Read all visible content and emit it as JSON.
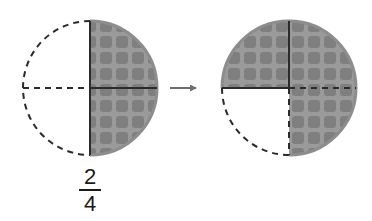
{
  "figure": {
    "background_color": "#ffffff",
    "shade_fill": "#9a9a9a",
    "shade_cell_color": "#7f7f7f",
    "outline_color": "#2b2b2b",
    "arrow_color": "#6e6e6e",
    "circles": [
      {
        "name": "left-circle",
        "cx": 90,
        "cy": 88,
        "r": 67,
        "total_parts": 4,
        "shaded_parts": 2,
        "quadrants": [
          {
            "name": "top-left",
            "shaded": false,
            "arc_style": "dashed"
          },
          {
            "name": "top-right",
            "shaded": true,
            "arc_style": "solid"
          },
          {
            "name": "bottom-right",
            "shaded": true,
            "arc_style": "solid"
          },
          {
            "name": "bottom-left",
            "shaded": false,
            "arc_style": "dashed"
          }
        ],
        "vertical_divider": "solid",
        "horizontal_divider_left": "dashed",
        "horizontal_divider_right": "solid"
      },
      {
        "name": "right-circle",
        "cx": 289,
        "cy": 88,
        "r": 67,
        "total_parts": 4,
        "shaded_parts": 3,
        "quadrants": [
          {
            "name": "top-left",
            "shaded": true,
            "arc_style": "solid"
          },
          {
            "name": "top-right",
            "shaded": true,
            "arc_style": "solid"
          },
          {
            "name": "bottom-right",
            "shaded": true,
            "arc_style": "solid"
          },
          {
            "name": "bottom-left",
            "shaded": false,
            "arc_style": "dashed"
          }
        ],
        "vertical_divider_top": "solid",
        "vertical_divider_bottom": "dashed",
        "horizontal_divider_left": "solid",
        "horizontal_divider_right": "dashed"
      }
    ],
    "arrow": {
      "name": "transform-arrow",
      "x1": 170,
      "x2": 202,
      "y": 88,
      "direction": "right"
    },
    "waffle": {
      "cell_pitch": 16,
      "cell_size": 12,
      "corner_radius": 3
    }
  },
  "fraction": {
    "numerator": "2",
    "denominator": "4",
    "value": "2/4"
  }
}
